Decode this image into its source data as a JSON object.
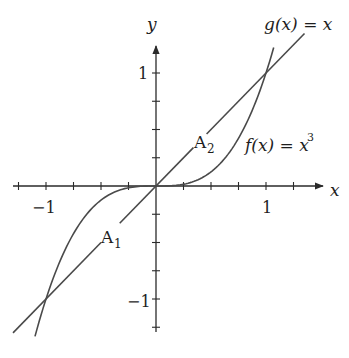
{
  "chart_data": {
    "type": "line",
    "title": "",
    "xlabel": "x",
    "ylabel": "y",
    "xlim": [
      -1.3,
      1.5
    ],
    "ylim": [
      -1.3,
      1.25
    ],
    "grid": false,
    "x_tick_step": 0.25,
    "y_tick_step": 0.25,
    "x_tick_labels": [
      {
        "value": -1,
        "label": "−1"
      },
      {
        "value": 1,
        "label": "1"
      }
    ],
    "y_tick_labels": [
      {
        "value": 1,
        "label": "1"
      },
      {
        "value": -1,
        "label": "−1"
      }
    ],
    "series": [
      {
        "name": "g(x) = x",
        "expression": "x",
        "x_range": [
          -1.3,
          1.35
        ],
        "intersections": [
          [
            -1,
            -1
          ],
          [
            0,
            0
          ],
          [
            1,
            1
          ]
        ]
      },
      {
        "name": "f(x) = x^3",
        "expression": "x^3",
        "x_range": [
          -1.1,
          1.07
        ]
      }
    ],
    "annotations": [
      {
        "text": "A",
        "subscript": "1",
        "region": "between f and g on [-1, 0]",
        "x": -0.4,
        "y": -0.45
      },
      {
        "text": "A",
        "subscript": "2",
        "region": "between g and f on [0, 1]",
        "x": 0.35,
        "y": 0.4
      }
    ]
  },
  "labels": {
    "x_axis": "x",
    "y_axis": "y",
    "g_label": "g(x) = x",
    "f_label_main": "f(x) = x",
    "f_label_exp": "3",
    "a1_main": "A",
    "a1_sub": "1",
    "a2_main": "A",
    "a2_sub": "2",
    "x_neg1": "−1",
    "x_pos1": "1",
    "y_pos1": "1",
    "y_neg1": "−1"
  }
}
